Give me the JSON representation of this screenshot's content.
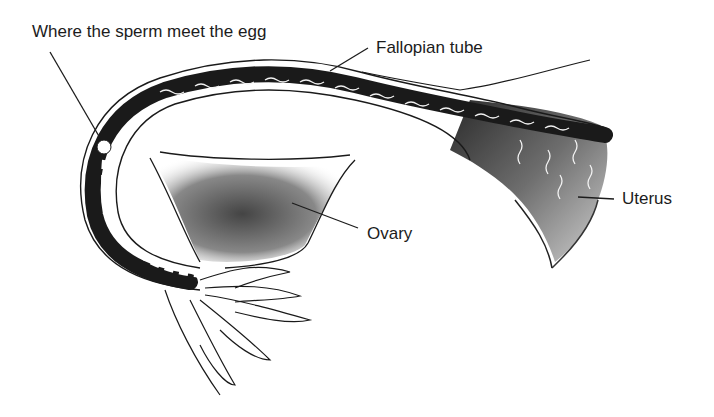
{
  "diagram": {
    "labels": {
      "meeting_point": "Where the sperm meet the egg",
      "fallopian_tube": "Fallopian tube",
      "ovary": "Ovary",
      "uterus": "Uterus"
    },
    "colors": {
      "background": "#ffffff",
      "ink": "#1c1c1c",
      "tube_fill": "#1a1a1a",
      "ovary_shade": "#6a6a6a",
      "uterus_shade": "#8a8a8a",
      "sperm": "#f2f2f2"
    }
  }
}
